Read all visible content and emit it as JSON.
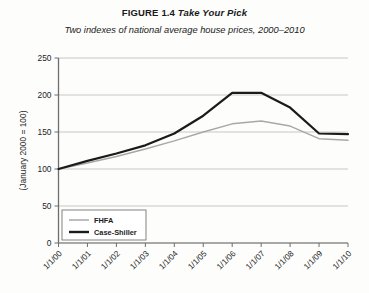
{
  "figure": {
    "label": "FIGURE 1.4",
    "name": "Take Your Pick",
    "subtitle": "Two indexes of national average house prices, 2000–2010"
  },
  "chart_data": {
    "type": "line",
    "title": "FIGURE 1.4 Take Your Pick",
    "subtitle": "Two indexes of national average house prices, 2000–2010",
    "xlabel": "",
    "ylabel": "(January 2000 = 100)",
    "categories": [
      "1/1/00",
      "1/1/01",
      "1/1/02",
      "1/1/03",
      "1/1/04",
      "1/1/05",
      "1/1/06",
      "1/1/07",
      "1/1/08",
      "1/1/09",
      "1/1/10"
    ],
    "xtick_labels": [
      "1/1/00",
      "1/1/01",
      "1/1/02",
      "1/1/03",
      "1/1/04",
      "1/1/05",
      "1/1/06",
      "1/1/07",
      "1/1/08",
      "1/1/09",
      "1/1/10"
    ],
    "ytick_labels": [
      "0",
      "50",
      "100",
      "150",
      "200",
      "250"
    ],
    "yticks": [
      0,
      50,
      100,
      150,
      200,
      250
    ],
    "ylim": [
      0,
      250
    ],
    "grid": true,
    "legend_position": "bottom-left",
    "series": [
      {
        "name": "FHFA",
        "color": "#a8a8a8",
        "width": 1.5,
        "values": [
          100,
          108,
          117,
          127,
          138,
          150,
          161,
          165,
          158,
          141,
          139
        ]
      },
      {
        "name": "Case-Shiller",
        "color": "#1b1b1b",
        "width": 2.2,
        "values": [
          100,
          111,
          121,
          132,
          148,
          172,
          203,
          203,
          183,
          148,
          147
        ]
      }
    ]
  },
  "legend": {
    "items": [
      {
        "label": "FHFA",
        "color": "#a8a8a8",
        "width": 1.5
      },
      {
        "label": "Case-Shiller",
        "color": "#1b1b1b",
        "width": 2.4
      }
    ]
  }
}
